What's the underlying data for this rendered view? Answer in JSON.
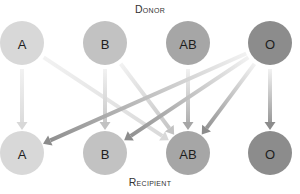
{
  "labels": {
    "donor": "Donor",
    "recipient": "Recipient"
  },
  "donors": [
    {
      "type": "A",
      "x": 22,
      "y": 43,
      "color": "#d8d8d8"
    },
    {
      "type": "B",
      "x": 105,
      "y": 43,
      "color": "#c2c2c2"
    },
    {
      "type": "AB",
      "x": 188,
      "y": 43,
      "color": "#a6a6a6"
    },
    {
      "type": "O",
      "x": 270,
      "y": 43,
      "color": "#8c8c8c"
    }
  ],
  "recipients": [
    {
      "type": "A",
      "x": 22,
      "y": 153,
      "color": "#d8d8d8"
    },
    {
      "type": "B",
      "x": 105,
      "y": 153,
      "color": "#c2c2c2"
    },
    {
      "type": "AB",
      "x": 188,
      "y": 153,
      "color": "#a6a6a6"
    },
    {
      "type": "O",
      "x": 270,
      "y": 153,
      "color": "#8c8c8c"
    }
  ],
  "node_radius": 22,
  "compatibility": [
    {
      "from": "A",
      "to": "A"
    },
    {
      "from": "A",
      "to": "AB"
    },
    {
      "from": "B",
      "to": "B"
    },
    {
      "from": "B",
      "to": "AB"
    },
    {
      "from": "AB",
      "to": "AB"
    },
    {
      "from": "O",
      "to": "A"
    },
    {
      "from": "O",
      "to": "B"
    },
    {
      "from": "O",
      "to": "AB"
    },
    {
      "from": "O",
      "to": "O"
    }
  ],
  "arrow_fade_color": "#f2f2f2"
}
